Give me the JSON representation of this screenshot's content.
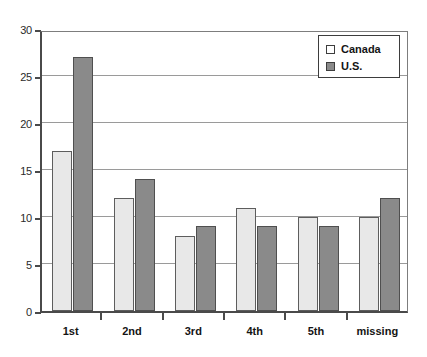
{
  "chart_data": {
    "type": "bar",
    "title": "",
    "xlabel": "",
    "ylabel": "",
    "categories": [
      "1st",
      "2nd",
      "3rd",
      "4th",
      "5th",
      "missing"
    ],
    "series": [
      {
        "name": "Canada",
        "values": [
          17,
          12,
          8,
          11,
          10,
          10
        ],
        "color": "#e8e8e8"
      },
      {
        "name": "U.S.",
        "values": [
          27,
          14,
          9,
          9,
          9,
          12
        ],
        "color": "#8a8a8a"
      }
    ],
    "ylim": [
      0,
      30
    ],
    "ytick_values": [
      0,
      5,
      10,
      15,
      20,
      25,
      30
    ],
    "ytick_labels": [
      "0",
      "5",
      "10",
      "15",
      "20",
      "25",
      "30"
    ],
    "grid": true,
    "grid_axis": "y",
    "legend_position": "top-right",
    "legend_entries": [
      "Canada",
      "U.S."
    ]
  },
  "legend": {
    "canada_label": "Canada",
    "us_label": "U.S."
  },
  "axis": {
    "y_min": 0,
    "y_max": 30,
    "y_step": 5
  }
}
